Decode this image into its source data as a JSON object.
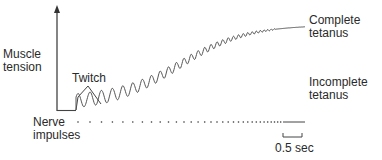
{
  "diagram": {
    "y_axis_label_line1": "Muscle",
    "y_axis_label_line2": "tension",
    "twitch_label": "Twitch",
    "complete_label_line1": "Complete",
    "complete_label_line2": "tetanus",
    "incomplete_label_line1": "Incomplete",
    "incomplete_label_line2": "tetanus",
    "impulses_label_line1": "Nerve",
    "impulses_label_line2": "impulses",
    "scale_label": "0.5 sec",
    "colors": {
      "line": "#555555",
      "text": "#2a2a2a",
      "background": "#ffffff"
    }
  }
}
